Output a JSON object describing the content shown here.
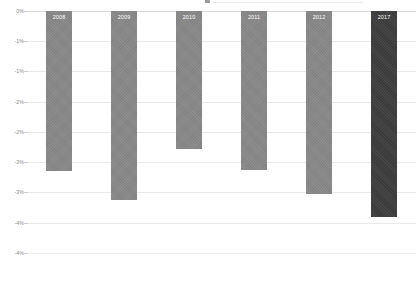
{
  "chart_data": {
    "type": "bar",
    "title": "",
    "subtitle": "",
    "xlabel": "",
    "ylabel": "",
    "categories": [
      "2008",
      "2009",
      "2010",
      "2011",
      "2012",
      "2017"
    ],
    "values": [
      -2.65,
      -3.12,
      -2.28,
      -2.63,
      -3.02,
      -3.4
    ],
    "series": [
      {
        "name": "Annual change",
        "values": [
          -2.65,
          -3.12,
          -2.28,
          -2.63,
          -3.02,
          -3.4
        ]
      }
    ],
    "ylim": [
      -4.5,
      0
    ],
    "ytick_labels": [
      "0%",
      "-1%",
      "-1%",
      "-2%",
      "-2%",
      "-3%",
      "-3%",
      "-4%",
      "-4%"
    ],
    "ytick_values": [
      0,
      -0.5,
      -1.0,
      -1.5,
      -2.0,
      -2.5,
      -3.0,
      -3.5,
      -4.0
    ],
    "grid": true,
    "legend": "none",
    "legend_position": "none",
    "annotations": [],
    "bar_colors": [
      "#878787",
      "#878787",
      "#878787",
      "#878787",
      "#878787",
      "#3c3c3c"
    ],
    "highlight_index": 5,
    "highlight_color": "#3c3c3c",
    "base_color": "#878787",
    "gridline_color": "#e9e9e9",
    "label_color": "#8a8a8a",
    "bar_label_color": "#ffffff"
  }
}
